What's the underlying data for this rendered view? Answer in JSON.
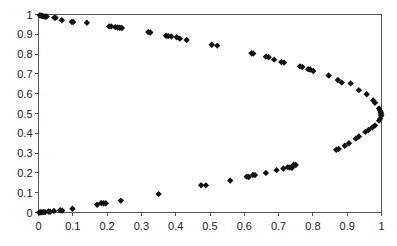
{
  "chart_data": {
    "type": "scatter",
    "title": "",
    "subtitle": "",
    "xlabel": "",
    "ylabel": "",
    "xlim": [
      0,
      1
    ],
    "ylim": [
      0,
      1
    ],
    "grid": false,
    "legend": null,
    "marker": {
      "shape": "diamond",
      "color": "#111111",
      "size": 3.2
    },
    "xticks": [
      0,
      0.1,
      0.2,
      0.3,
      0.4,
      0.5,
      0.6,
      0.7,
      0.8,
      0.9,
      1
    ],
    "xticklabels": [
      "0",
      "0.1",
      "0.2",
      "0.3",
      "0.4",
      "0.5",
      "0.6",
      "0.7",
      "0.8",
      "0.9",
      "1"
    ],
    "yticks": [
      0,
      0.1,
      0.2,
      0.3,
      0.4,
      0.5,
      0.6,
      0.7,
      0.8,
      0.9,
      1
    ],
    "yticklabels": [
      "0",
      "0.1",
      "0.2",
      "0.3",
      "0.4",
      "0.5",
      "0.6",
      "0.7",
      "0.8",
      "0.9",
      "1"
    ],
    "series": [
      {
        "name": "points",
        "points": [
          [
            0.004,
            0.996
          ],
          [
            0.008,
            0.994
          ],
          [
            0.01,
            0.993
          ],
          [
            0.013,
            0.992
          ],
          [
            0.016,
            0.99
          ],
          [
            0.02,
            0.989
          ],
          [
            0.024,
            0.99
          ],
          [
            0.046,
            0.984
          ],
          [
            0.05,
            0.983
          ],
          [
            0.068,
            0.971
          ],
          [
            0.097,
            0.963
          ],
          [
            0.101,
            0.962
          ],
          [
            0.141,
            0.958
          ],
          [
            0.206,
            0.94
          ],
          [
            0.212,
            0.94
          ],
          [
            0.224,
            0.936
          ],
          [
            0.231,
            0.934
          ],
          [
            0.237,
            0.933
          ],
          [
            0.243,
            0.932
          ],
          [
            0.32,
            0.911
          ],
          [
            0.326,
            0.909
          ],
          [
            0.372,
            0.893
          ],
          [
            0.378,
            0.891
          ],
          [
            0.387,
            0.889
          ],
          [
            0.403,
            0.885
          ],
          [
            0.412,
            0.878
          ],
          [
            0.432,
            0.871
          ],
          [
            0.505,
            0.847
          ],
          [
            0.521,
            0.843
          ],
          [
            0.621,
            0.804
          ],
          [
            0.626,
            0.803
          ],
          [
            0.663,
            0.787
          ],
          [
            0.671,
            0.784
          ],
          [
            0.687,
            0.772
          ],
          [
            0.708,
            0.76
          ],
          [
            0.716,
            0.757
          ],
          [
            0.762,
            0.738
          ],
          [
            0.769,
            0.735
          ],
          [
            0.786,
            0.724
          ],
          [
            0.792,
            0.722
          ],
          [
            0.801,
            0.715
          ],
          [
            0.846,
            0.692
          ],
          [
            0.873,
            0.669
          ],
          [
            0.884,
            0.656
          ],
          [
            0.91,
            0.652
          ],
          [
            0.934,
            0.618
          ],
          [
            0.957,
            0.597
          ],
          [
            0.976,
            0.566
          ],
          [
            0.981,
            0.554
          ],
          [
            0.993,
            0.525
          ],
          [
            0.996,
            0.514
          ],
          [
            0.998,
            0.506
          ],
          [
            0.999,
            0.497
          ],
          [
            0.999,
            0.489
          ],
          [
            0.996,
            0.473
          ],
          [
            0.993,
            0.464
          ],
          [
            0.981,
            0.44
          ],
          [
            0.973,
            0.429
          ],
          [
            0.962,
            0.417
          ],
          [
            0.953,
            0.407
          ],
          [
            0.934,
            0.384
          ],
          [
            0.925,
            0.373
          ],
          [
            0.905,
            0.35
          ],
          [
            0.893,
            0.337
          ],
          [
            0.875,
            0.321
          ],
          [
            0.868,
            0.317
          ],
          [
            0.744,
            0.241
          ],
          [
            0.75,
            0.24
          ],
          [
            0.727,
            0.229
          ],
          [
            0.733,
            0.227
          ],
          [
            0.739,
            0.226
          ],
          [
            0.714,
            0.222
          ],
          [
            0.694,
            0.214
          ],
          [
            0.663,
            0.2
          ],
          [
            0.625,
            0.19
          ],
          [
            0.631,
            0.189
          ],
          [
            0.607,
            0.181
          ],
          [
            0.613,
            0.179
          ],
          [
            0.559,
            0.161
          ],
          [
            0.474,
            0.138
          ],
          [
            0.488,
            0.137
          ],
          [
            0.35,
            0.093
          ],
          [
            0.24,
            0.06
          ],
          [
            0.183,
            0.048
          ],
          [
            0.19,
            0.047
          ],
          [
            0.196,
            0.047
          ],
          [
            0.171,
            0.039
          ],
          [
            0.099,
            0.019
          ],
          [
            0.063,
            0.011
          ],
          [
            0.069,
            0.01
          ],
          [
            0.045,
            0.008
          ],
          [
            0.029,
            0.005
          ],
          [
            0.034,
            0.004
          ],
          [
            0.015,
            0.002
          ],
          [
            0.019,
            0.002
          ],
          [
            0.006,
            0.001
          ],
          [
            0.01,
            0.001
          ],
          [
            0.002,
            0.0
          ]
        ]
      }
    ]
  },
  "axes": {
    "left_label": "y-axis",
    "bottom_label": "x-axis"
  }
}
